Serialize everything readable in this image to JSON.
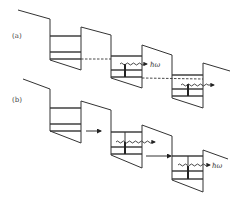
{
  "figure": {
    "panels": [
      {
        "label": "(a)",
        "transport": "resonant tunnelling (dashed)",
        "photon_labels": [
          "ħω",
          ""
        ]
      },
      {
        "label": "(b)",
        "transport": "sequential (solid arrows)",
        "photon_labels": [
          "",
          "ħω"
        ]
      }
    ],
    "colors": {
      "line": "#333333",
      "background": "#ffffff"
    }
  }
}
